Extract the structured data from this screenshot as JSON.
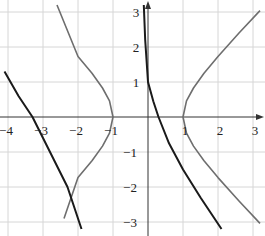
{
  "chart_data": {
    "type": "line",
    "title": "",
    "xlabel": "",
    "ylabel": "",
    "xlim": [
      -4.2,
      3.3
    ],
    "ylim": [
      -3.2,
      3.3
    ],
    "grid": true,
    "x_ticks": [
      -4,
      -3,
      -2,
      -1,
      1,
      2,
      3
    ],
    "x_tick_labels": [
      "−4",
      "−3",
      "−2",
      "−1",
      "1",
      "2",
      "3"
    ],
    "y_ticks": [
      3,
      2,
      1,
      -1,
      -2,
      -3
    ],
    "y_tick_labels": [
      "3",
      "2",
      "1",
      "−1",
      "−2",
      "−3"
    ],
    "series": [
      {
        "name": "gray hyperbola (x² − y² = 1)",
        "color": "#6e6e6e",
        "branches": [
          {
            "x": [
              3.2,
              2.6,
              2.0,
              1.6,
              1.3,
              1.1,
              1.0,
              1.1,
              1.3,
              1.6,
              2.0,
              2.6,
              3.2
            ],
            "y": [
              3.04,
              2.4,
              1.73,
              1.25,
              0.83,
              0.46,
              0.0,
              -0.46,
              -0.83,
              -1.25,
              -1.73,
              -2.4,
              -3.04
            ]
          },
          {
            "x": [
              -2.6,
              -2.0,
              -1.6,
              -1.3,
              -1.1,
              -1.0,
              -1.1,
              -1.3,
              -1.6,
              -2.0,
              -2.4
            ],
            "y": [
              3.2,
              1.73,
              1.25,
              0.83,
              0.46,
              0.0,
              -0.46,
              -0.83,
              -1.25,
              -1.73,
              -2.9
            ]
          }
        ]
      },
      {
        "name": "black curve",
        "color": "#1a1a1a",
        "branches": [
          {
            "x": [
              -0.12,
              -0.08,
              0.0,
              0.15,
              0.3,
              0.6,
              1.0,
              1.5,
              2.1
            ],
            "y": [
              3.2,
              2.2,
              1.0,
              0.45,
              0.0,
              -0.75,
              -1.5,
              -2.3,
              -3.2
            ]
          },
          {
            "x": [
              -4.1,
              -3.7,
              -3.3,
              -3.0,
              -2.7,
              -2.3,
              -1.9
            ],
            "y": [
              1.3,
              0.6,
              0.0,
              -0.6,
              -1.2,
              -2.0,
              -3.2
            ]
          }
        ]
      }
    ],
    "legend": null,
    "annotations": []
  }
}
